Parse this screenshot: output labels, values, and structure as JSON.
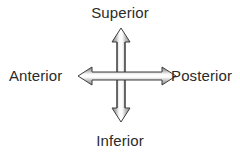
{
  "figure": {
    "kind": "anatomical-direction-diagram",
    "background_color": "#ffffff",
    "text_color": "#2b2b2b"
  },
  "labels": {
    "superior": "Superior",
    "inferior": "Inferior",
    "anterior": "Anterior",
    "posterior": "Posterior"
  },
  "arrow": {
    "icon_name": "four-way-cross-arrow-icon",
    "outline_color": "#3a3a3a",
    "fill_light": "#f6f6f6",
    "fill_mid": "#b8b8b8",
    "fill_dark": "#8a8a8a",
    "directions": [
      "up",
      "down",
      "left",
      "right"
    ]
  }
}
